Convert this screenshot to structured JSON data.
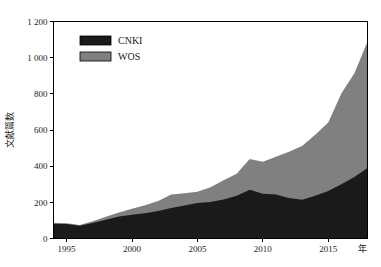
{
  "chart_data": {
    "type": "area",
    "stacked": true,
    "title": "",
    "subtitle": "",
    "xlabel": "年",
    "ylabel": "文献篇数",
    "xlim": [
      1994,
      2018
    ],
    "ylim": [
      0,
      1200
    ],
    "grid": false,
    "legend_position": "top-left",
    "x": [
      1994,
      1995,
      1996,
      1997,
      1998,
      1999,
      2000,
      2001,
      2002,
      2003,
      2004,
      2005,
      2006,
      2007,
      2008,
      2009,
      2010,
      2011,
      2012,
      2013,
      2014,
      2015,
      2016,
      2017,
      2018
    ],
    "x_tick_labels": [
      "1995",
      "2000",
      "2005",
      "2010",
      "2015"
    ],
    "x_tick_values": [
      1995,
      2000,
      2005,
      2010,
      2015
    ],
    "y_tick_labels": [
      "0",
      "200",
      "400",
      "600",
      "800",
      "1 000",
      "1 200"
    ],
    "y_tick_values": [
      0,
      200,
      400,
      600,
      800,
      1000,
      1200
    ],
    "series": [
      {
        "name": "CNKI",
        "color": "#1a1a1a",
        "values": [
          82,
          80,
          70,
          86,
          104,
          122,
          132,
          140,
          152,
          168,
          182,
          196,
          202,
          216,
          236,
          270,
          248,
          244,
          224,
          214,
          236,
          262,
          300,
          340,
          390
        ]
      },
      {
        "name": "WOS",
        "color": "#808080",
        "values": [
          4,
          4,
          4,
          10,
          16,
          22,
          32,
          44,
          56,
          76,
          68,
          62,
          82,
          106,
          122,
          170,
          176,
          208,
          256,
          298,
          338,
          380,
          502,
          574,
          700
        ]
      }
    ],
    "totals": [
      86,
      84,
      74,
      96,
      120,
      144,
      164,
      184,
      208,
      244,
      250,
      258,
      284,
      322,
      358,
      440,
      424,
      452,
      480,
      512,
      574,
      642,
      802,
      914,
      1090
    ]
  },
  "legend": {
    "items": [
      {
        "label": "CNKI",
        "color": "#1a1a1a"
      },
      {
        "label": "WOS",
        "color": "#808080"
      }
    ]
  },
  "axes": {
    "y_axis_title": "文献篇数",
    "x_axis_unit": "年"
  }
}
